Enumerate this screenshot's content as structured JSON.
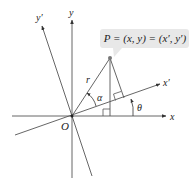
{
  "diagram": {
    "type": "coordinate-rotation",
    "axes": {
      "x_label": "x",
      "y_label": "y",
      "x_prime_label": "x′",
      "y_prime_label": "y′",
      "origin_label": "O"
    },
    "point": {
      "callout": "P = (x, y) = (x′, y′)"
    },
    "angles": {
      "alpha": "α",
      "theta": "θ"
    },
    "segment": {
      "radius_label": "r"
    },
    "colors": {
      "line": "#555555",
      "callout_bg": "#e8e8e8",
      "point": "#777777"
    }
  }
}
